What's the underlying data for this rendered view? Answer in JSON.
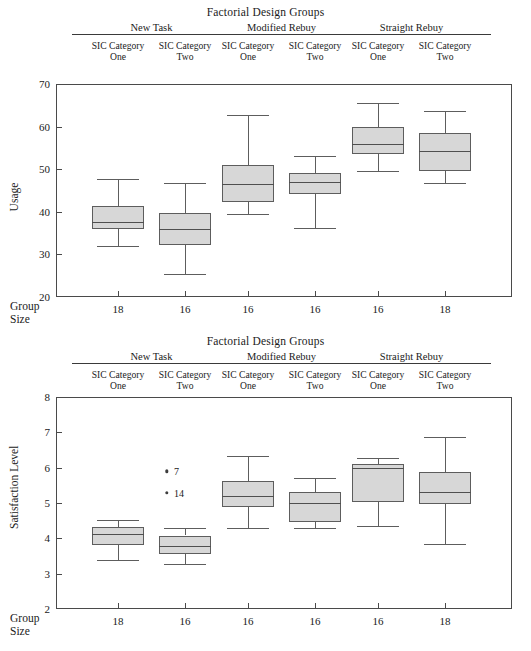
{
  "figure": {
    "width": 531,
    "height": 651,
    "box_fill_color": "#d7d7d7",
    "box_border_color": "#5d5d5d",
    "frame_color": "#4a4a4a"
  },
  "header": {
    "title": "Factorial Design Groups",
    "factors": [
      {
        "name": "New Task",
        "levels": [
          "SIC Category One",
          "SIC Category Two"
        ]
      },
      {
        "name": "Modified Rebuy",
        "levels": [
          "SIC Category One",
          "SIC Category Two"
        ]
      },
      {
        "name": "Straight Rebuy",
        "levels": [
          "SIC Category One",
          "SIC Category Two"
        ]
      }
    ],
    "level_line1": "SIC Category",
    "level_line2_values": [
      "One",
      "Two",
      "One",
      "Two",
      "One",
      "Two"
    ]
  },
  "group_size_label": {
    "line1": "Group",
    "line2": "Size"
  },
  "chart_data": [
    {
      "type": "boxplot",
      "title": "Factorial Design Groups",
      "ylabel": "Usage",
      "xlabel": "Group Size",
      "ylim": [
        20,
        70
      ],
      "yticks": [
        20,
        30,
        40,
        50,
        60,
        70
      ],
      "grid": false,
      "legend": "none",
      "categories": [
        "18",
        "16",
        "16",
        "16",
        "16",
        "18"
      ],
      "group_sizes": [
        18,
        16,
        16,
        16,
        16,
        18
      ],
      "boxes": [
        {
          "label": "New Task / SIC Category One",
          "whisker_low": 31.9,
          "q1": 35.9,
          "median": 37.7,
          "q3": 41.3,
          "whisker_high": 47.7,
          "outliers": []
        },
        {
          "label": "New Task / SIC Category Two",
          "whisker_low": 25.4,
          "q1": 32.2,
          "median": 36.0,
          "q3": 39.8,
          "whisker_high": 46.8,
          "outliers": []
        },
        {
          "label": "Modified Rebuy / SIC Category One",
          "whisker_low": 39.5,
          "q1": 42.4,
          "median": 46.5,
          "q3": 51.1,
          "whisker_high": 62.7,
          "outliers": []
        },
        {
          "label": "Modified Rebuy / SIC Category Two",
          "whisker_low": 36.3,
          "q1": 44.2,
          "median": 46.9,
          "q3": 49.1,
          "whisker_high": 53.1,
          "outliers": []
        },
        {
          "label": "Straight Rebuy / SIC Category One",
          "whisker_low": 49.5,
          "q1": 53.6,
          "median": 55.9,
          "q3": 59.9,
          "whisker_high": 65.6,
          "outliers": []
        },
        {
          "label": "Straight Rebuy / SIC Category Two",
          "whisker_low": 46.7,
          "q1": 49.6,
          "median": 54.3,
          "q3": 58.4,
          "whisker_high": 63.7,
          "outliers": []
        }
      ]
    },
    {
      "type": "boxplot",
      "title": "Factorial Design Groups",
      "ylabel": "Satisfaction Level",
      "xlabel": "Group Size",
      "ylim": [
        2,
        8
      ],
      "yticks": [
        2,
        3,
        4,
        5,
        6,
        7,
        8
      ],
      "grid": false,
      "legend": "none",
      "categories": [
        "18",
        "16",
        "16",
        "16",
        "16",
        "18"
      ],
      "group_sizes": [
        18,
        16,
        16,
        16,
        16,
        18
      ],
      "boxes": [
        {
          "label": "New Task / SIC Category One",
          "whisker_low": 3.4,
          "q1": 3.82,
          "median": 4.13,
          "q3": 4.33,
          "whisker_high": 4.53,
          "outliers": []
        },
        {
          "label": "New Task / SIC Category Two",
          "whisker_low": 3.26,
          "q1": 3.56,
          "median": 3.79,
          "q3": 4.08,
          "whisker_high": 4.3,
          "outliers": [
            {
              "value": 5.9,
              "label": "7"
            },
            {
              "value": 5.28,
              "label": "14"
            }
          ]
        },
        {
          "label": "Modified Rebuy / SIC Category One",
          "whisker_low": 4.3,
          "q1": 4.9,
          "median": 5.21,
          "q3": 5.61,
          "whisker_high": 6.33,
          "outliers": []
        },
        {
          "label": "Modified Rebuy / SIC Category Two",
          "whisker_low": 4.28,
          "q1": 4.45,
          "median": 5.0,
          "q3": 5.3,
          "whisker_high": 5.72,
          "outliers": []
        },
        {
          "label": "Straight Rebuy / SIC Category One",
          "whisker_low": 4.36,
          "q1": 5.03,
          "median": 6.0,
          "q3": 6.1,
          "whisker_high": 6.26,
          "outliers": []
        },
        {
          "label": "Straight Rebuy / SIC Category Two",
          "whisker_low": 3.85,
          "q1": 4.96,
          "median": 5.32,
          "q3": 5.88,
          "whisker_high": 6.88,
          "outliers": []
        }
      ]
    }
  ],
  "geometry": {
    "plot_left": 56,
    "plot_right": 512,
    "panel1": {
      "title_y": 6,
      "header_top": 22,
      "plot_top": 84,
      "plot_bottom": 297,
      "xlabels_y": 303,
      "groupsize_y": 300
    },
    "panel2": {
      "title_y": 335,
      "header_top": 351,
      "plot_top": 397,
      "plot_bottom": 609,
      "xlabels_y": 615,
      "groupsize_y": 612
    },
    "box_centers": [
      118,
      185,
      248,
      315,
      378,
      445
    ],
    "box_half_width": 26,
    "cap_half_width": 21
  }
}
